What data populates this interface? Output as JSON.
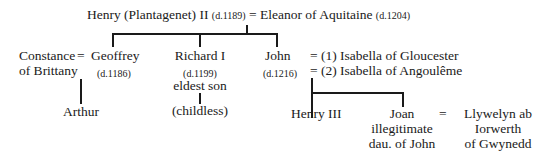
{
  "tree": {
    "root": {
      "husband": "Henry (Plantagenet) II",
      "husband_death": "(d.1189)",
      "eq": "=",
      "wife": "Eleanor of Aquitaine",
      "wife_death": "(d.1204)"
    },
    "constance": {
      "line1": "Constance",
      "line2": "of Brittany",
      "eq": "="
    },
    "geoffrey": {
      "name": "Geoffrey",
      "death": "(d.1186)"
    },
    "richard": {
      "name": "Richard I",
      "death": "(d.1199)",
      "note": "eldest son",
      "child": "(childless)"
    },
    "john": {
      "name": "John",
      "death": "(d.1216)",
      "wife1": "= (1) Isabella of Gloucester",
      "wife2": "= (2) Isabella of Angoulême"
    },
    "arthur": "Arthur",
    "henry3": "Henry III",
    "joan": {
      "line1": "Joan",
      "line2": "illegitimate",
      "line3": "dau. of John",
      "eq": "="
    },
    "llywelyn": {
      "line1": "Llywelyn ab",
      "line2": "Iorwerth",
      "line3": "of Gwynedd"
    }
  }
}
